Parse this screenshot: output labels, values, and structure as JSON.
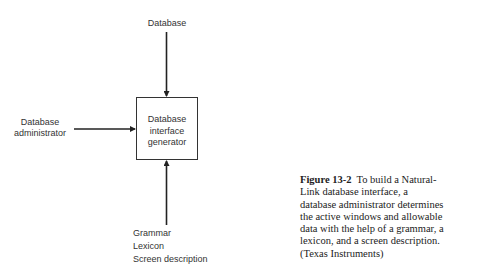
{
  "diagram": {
    "top_input": {
      "label": "Database"
    },
    "left_input": {
      "label_lines": [
        "Database",
        "administrator"
      ]
    },
    "center_box": {
      "label_lines": [
        "Database",
        "interface",
        "generator"
      ]
    },
    "bottom_input": {
      "label_lines": [
        "Grammar",
        "Lexicon",
        "Screen description"
      ]
    },
    "edges": [
      {
        "from": "Database",
        "to": "Database interface generator"
      },
      {
        "from": "Database administrator",
        "to": "Database interface generator"
      },
      {
        "from": "Grammar / Lexicon / Screen description",
        "to": "Database interface generator"
      }
    ],
    "line_color": "#222222"
  },
  "caption": {
    "figure_label": "Figure 13-2",
    "text_lines": [
      "To build a Natural-",
      "Link database interface, a",
      "database administrator determines",
      "the active windows and allowable",
      "data with the help of a grammar, a",
      "lexicon, and a screen description.",
      "(Texas Instruments)"
    ]
  }
}
